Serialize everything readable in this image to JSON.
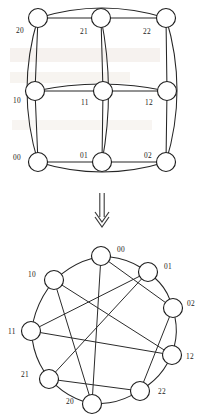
{
  "figure": {
    "node_radius_grid": 9.5,
    "node_radius_circle": 9.5,
    "stroke_color": "#262626",
    "node_fill": "#ffffff",
    "label_color": "#1a1a1a"
  },
  "arrow": {
    "name": "double-line-down-arrow",
    "direction": "down",
    "x": 102,
    "y_start": 193,
    "y_end": 226
  },
  "grid_graph": {
    "name": "torus-grid-view",
    "caption": "",
    "nodes": [
      {
        "id": "20",
        "label": "20",
        "cx": 38,
        "cy": 18,
        "label_x": 16,
        "label_y": 33
      },
      {
        "id": "21",
        "label": "21",
        "cx": 101,
        "cy": 18,
        "label_x": 80,
        "label_y": 34
      },
      {
        "id": "22",
        "label": "22",
        "cx": 166,
        "cy": 18,
        "label_x": 143,
        "label_y": 34
      },
      {
        "id": "10",
        "label": "10",
        "cx": 35,
        "cy": 91,
        "label_x": 13,
        "label_y": 103
      },
      {
        "id": "11",
        "label": "11",
        "cx": 103,
        "cy": 91,
        "label_x": 81,
        "label_y": 105
      },
      {
        "id": "12",
        "label": "12",
        "cx": 167,
        "cy": 91,
        "label_x": 145,
        "label_y": 105
      },
      {
        "id": "00",
        "label": "00",
        "cx": 38,
        "cy": 162,
        "label_x": 13,
        "label_y": 160
      },
      {
        "id": "01",
        "label": "01",
        "cx": 102,
        "cy": 162,
        "label_x": 80,
        "label_y": 158
      },
      {
        "id": "02",
        "label": "02",
        "cx": 166,
        "cy": 162,
        "label_x": 144,
        "label_y": 158
      }
    ],
    "straight_edges": [
      [
        "20",
        "21"
      ],
      [
        "21",
        "22"
      ],
      [
        "10",
        "11"
      ],
      [
        "11",
        "12"
      ],
      [
        "00",
        "01"
      ],
      [
        "01",
        "02"
      ],
      [
        "20",
        "10"
      ],
      [
        "10",
        "00"
      ],
      [
        "21",
        "11"
      ],
      [
        "11",
        "01"
      ],
      [
        "22",
        "12"
      ],
      [
        "12",
        "02"
      ]
    ],
    "wrap_edges": [
      {
        "from": "20",
        "to": "22",
        "kind": "row-wrap-top"
      },
      {
        "from": "10",
        "to": "12",
        "kind": "row-wrap-middle"
      },
      {
        "from": "00",
        "to": "02",
        "kind": "row-wrap-bottom"
      },
      {
        "from": "20",
        "to": "00",
        "kind": "col-wrap-left"
      },
      {
        "from": "21",
        "to": "01",
        "kind": "col-wrap-middle"
      },
      {
        "from": "22",
        "to": "02",
        "kind": "col-wrap-right"
      }
    ]
  },
  "circular_graph": {
    "name": "torus-circular-view",
    "caption": "",
    "center_x": 101,
    "center_y": 330,
    "radius": 74,
    "nodes": [
      {
        "id": "00",
        "label": "00",
        "cx": 101,
        "cy": 256,
        "label_x": 117,
        "label_y": 252,
        "angle_deg": 270
      },
      {
        "id": "01",
        "label": "01",
        "cx": 148,
        "cy": 272,
        "label_x": 164,
        "label_y": 269,
        "angle_deg": 310
      },
      {
        "id": "02",
        "label": "02",
        "cx": 173,
        "cy": 308,
        "label_x": 187,
        "label_y": 306,
        "angle_deg": 350
      },
      {
        "id": "12",
        "label": "12",
        "cx": 172,
        "cy": 355,
        "label_x": 186,
        "label_y": 359,
        "angle_deg": 30
      },
      {
        "id": "22",
        "label": "22",
        "cx": 140,
        "cy": 391,
        "label_x": 158,
        "label_y": 394,
        "angle_deg": 70
      },
      {
        "id": "20",
        "label": "20",
        "cx": 92,
        "cy": 404,
        "label_x": 66,
        "label_y": 404,
        "angle_deg": 110
      },
      {
        "id": "21",
        "label": "21",
        "cx": 49,
        "cy": 379,
        "label_x": 21,
        "label_y": 377,
        "angle_deg": 150
      },
      {
        "id": "11",
        "label": "11",
        "cx": 31,
        "cy": 331,
        "label_x": 8,
        "label_y": 334,
        "angle_deg": 190
      },
      {
        "id": "10",
        "label": "10",
        "cx": 54,
        "cy": 280,
        "label_x": 28,
        "label_y": 277,
        "angle_deg": 230
      }
    ],
    "ring_edges": [
      [
        "00",
        "01"
      ],
      [
        "01",
        "02"
      ],
      [
        "02",
        "12"
      ],
      [
        "12",
        "22"
      ],
      [
        "22",
        "20"
      ],
      [
        "20",
        "21"
      ],
      [
        "21",
        "11"
      ],
      [
        "11",
        "10"
      ],
      [
        "10",
        "00"
      ]
    ],
    "chord_edges": [
      [
        "00",
        "02"
      ],
      [
        "00",
        "20"
      ],
      [
        "01",
        "11"
      ],
      [
        "01",
        "21"
      ],
      [
        "02",
        "01"
      ],
      [
        "10",
        "12"
      ],
      [
        "10",
        "20"
      ],
      [
        "11",
        "12"
      ],
      [
        "12",
        "02"
      ],
      [
        "20",
        "21"
      ],
      [
        "21",
        "22"
      ],
      [
        "22",
        "02"
      ],
      [
        "00",
        "10"
      ],
      [
        "11",
        "21"
      ],
      [
        "22",
        "12"
      ]
    ],
    "chord_list_explicit": [
      {
        "from": "00",
        "to": "02"
      },
      {
        "from": "00",
        "to": "20"
      },
      {
        "from": "01",
        "to": "11"
      },
      {
        "from": "01",
        "to": "21"
      },
      {
        "from": "10",
        "to": "12"
      },
      {
        "from": "10",
        "to": "20"
      },
      {
        "from": "11",
        "to": "12"
      },
      {
        "from": "21",
        "to": "22"
      },
      {
        "from": "22",
        "to": "02"
      }
    ]
  },
  "watermark": {
    "visible": true,
    "line1": "",
    "line2": ""
  }
}
